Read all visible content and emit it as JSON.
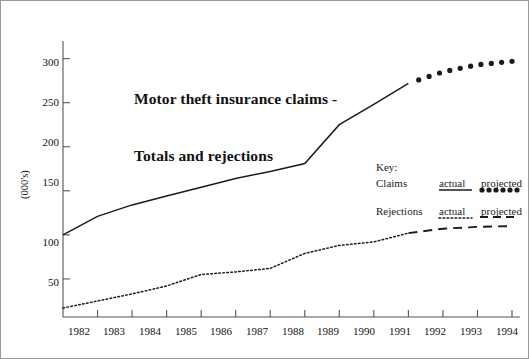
{
  "chart_data": {
    "type": "line",
    "title": "Motor theft insurance claims -\nTotals and rejections",
    "title_line1": "Motor theft insurance claims -",
    "title_line2": "Totals and rejections",
    "xlabel": "",
    "ylabel": "(000's)",
    "grid": false,
    "xlim": [
      1981,
      1994
    ],
    "ylim": [
      0,
      320
    ],
    "yticks": [
      50,
      100,
      150,
      200,
      250,
      300
    ],
    "xticks": [
      1982,
      1983,
      1984,
      1985,
      1986,
      1987,
      1988,
      1989,
      1990,
      1991,
      1992,
      1993,
      1994
    ],
    "x": [
      1981,
      1982,
      1983,
      1984,
      1985,
      1986,
      1987,
      1988,
      1989,
      1990,
      1991,
      1992,
      1993,
      1994
    ],
    "series": [
      {
        "name": "Claims",
        "style": "solid",
        "segment": "actual",
        "x": [
          1981,
          1982,
          1983,
          1984,
          1985,
          1986,
          1987,
          1988,
          1989,
          1990,
          1991
        ],
        "values": [
          100,
          121,
          134,
          144,
          154,
          164,
          172,
          181,
          225,
          248,
          272
        ]
      },
      {
        "name": "Claims",
        "style": "dotted-markers",
        "segment": "projected",
        "x": [
          1991,
          1992,
          1993,
          1994
        ],
        "values": [
          272,
          285,
          293,
          297
        ]
      },
      {
        "name": "Rejections",
        "style": "dotted",
        "segment": "actual",
        "x": [
          1981,
          1982,
          1983,
          1984,
          1985,
          1986,
          1987,
          1988,
          1989,
          1990,
          1991
        ],
        "values": [
          17,
          25,
          33,
          42,
          55,
          58,
          62,
          79,
          88,
          92,
          102
        ]
      },
      {
        "name": "Rejections",
        "style": "dashed",
        "segment": "projected",
        "x": [
          1991,
          1992,
          1993,
          1994
        ],
        "values": [
          102,
          107,
          109,
          110
        ]
      }
    ],
    "legend": {
      "position": "inside-right",
      "key_label": "Key:",
      "rows": [
        {
          "name": "Claims",
          "actual_label": "actual",
          "projected_label": "projected"
        },
        {
          "name": "Rejections",
          "actual_label": "actual",
          "projected_label": "projected"
        }
      ]
    },
    "colors": {
      "line": "#1b1b1b",
      "axis": "#555555",
      "border": "#9a9a9a",
      "text": "#111111"
    }
  },
  "axis": {
    "y_title": "(000's)",
    "y_labels": [
      "300",
      "250",
      "200",
      "150",
      "100",
      "50"
    ],
    "x_labels": [
      "1982",
      "1983",
      "1984",
      "1985",
      "1986",
      "1987",
      "1988",
      "1989",
      "1990",
      "1991",
      "1992",
      "1993",
      "1994"
    ]
  },
  "title": {
    "line1": "Motor theft insurance claims -",
    "line2": "Totals and rejections"
  },
  "legend": {
    "key": "Key:",
    "claims": "Claims",
    "rejections": "Rejections",
    "claims_actual": "actual",
    "claims_projected": "projected",
    "rejections_actual": "actual",
    "rejections_projected": "projected"
  }
}
